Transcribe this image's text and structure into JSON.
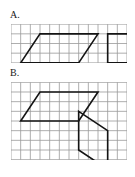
{
  "figure": {
    "background_color": "#ffffff",
    "grid_line_color": "#9a9a9a",
    "grid_line_width": 0.8,
    "shape_line_color": "#141414",
    "shape_line_width": 1.6,
    "cell_size": 9.6
  },
  "panels": [
    {
      "id": "A",
      "label": "A.",
      "grid": {
        "columns": 12,
        "rows": 4,
        "cell_size": 9.6,
        "width": 115.2,
        "height": 38.4
      },
      "shapes": [
        {
          "name": "parallelogram-left",
          "type": "parallelogram",
          "vertices_cells": [
            [
              1,
              4
            ],
            [
              3,
              1
            ],
            [
              9,
              1
            ],
            [
              7,
              4
            ]
          ],
          "closed": true
        },
        {
          "name": "rectangle-right",
          "type": "rectangle",
          "vertices_cells": [
            [
              10,
              4
            ],
            [
              10,
              1
            ],
            [
              16,
              1
            ],
            [
              16,
              4
            ]
          ],
          "closed": true
        }
      ]
    },
    {
      "id": "B",
      "label": "B.",
      "grid": {
        "columns": 12,
        "rows": 8,
        "cell_size": 9.6,
        "width": 115.2,
        "height": 76.8
      },
      "shapes": [
        {
          "name": "parallelogram-upper-left",
          "type": "parallelogram",
          "vertices_cells": [
            [
              1,
              4
            ],
            [
              3,
              1
            ],
            [
              9,
              1
            ],
            [
              7,
              4
            ]
          ],
          "closed": true
        },
        {
          "name": "parallelogram-right",
          "type": "parallelogram",
          "vertices_cells": [
            [
              7,
              3
            ],
            [
              10,
              5
            ],
            [
              10,
              9
            ],
            [
              7,
              7
            ]
          ],
          "closed": true
        }
      ]
    }
  ],
  "chart_data": {
    "type": "table",
    "xlabel": "",
    "ylabel": "",
    "categories": [
      "Panel A",
      "Panel B"
    ],
    "series": [
      {
        "name": "grid columns",
        "values": [
          12,
          12
        ]
      },
      {
        "name": "grid rows",
        "values": [
          4,
          8
        ]
      },
      {
        "name": "shape count",
        "values": [
          2,
          2
        ]
      }
    ],
    "annotations": [
      "Panel A: parallelogram (base 6, height 3, slant run 2) and rectangle (6 x 3)",
      "Panel B: parallelogram (base 6, height 3, slant run 2) and tilted parallelogram (height 4, run 3)"
    ],
    "grid": true,
    "legend_position": "none"
  }
}
